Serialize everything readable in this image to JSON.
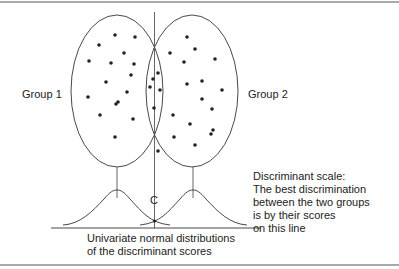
{
  "figure": {
    "labels": {
      "group_1": "Group 1",
      "group_2": "Group 2",
      "cutoff": "C"
    },
    "discriminant_scale_note": [
      "Discriminant scale:",
      "The best discrimination",
      "between the two groups",
      "is by their scores",
      "on this line"
    ],
    "distribution_note": [
      "Univariate normal distributions",
      "of the discriminant scores"
    ],
    "colors": {
      "stroke": "#333333",
      "dot": "#222222",
      "border": "#444444",
      "background": "#ffffff"
    }
  }
}
